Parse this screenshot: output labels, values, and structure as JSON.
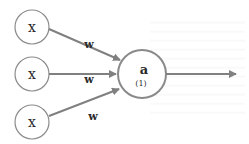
{
  "diagram": {
    "type": "perceptron",
    "inputs": [
      {
        "label": "x",
        "weight_label": "w"
      },
      {
        "label": "x",
        "weight_label": "w"
      },
      {
        "label": "x",
        "weight_label": "w"
      }
    ],
    "neuron": {
      "label": "a",
      "sublabel": "(1)"
    },
    "output_arrow": true,
    "colors": {
      "stroke": "#8a8a8a",
      "arrow": "#808080",
      "text": "#2a2a2a",
      "background": "#ffffff"
    }
  }
}
